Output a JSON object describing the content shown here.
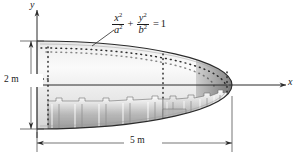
{
  "figure": {
    "background_color": "#ffffff"
  },
  "axes": {
    "y_label": "y",
    "x_label": "x",
    "origin_note": "y-axis at left end of ellipse, x-axis along centerline"
  },
  "equation": {
    "numerator_1": "x",
    "numerator_1_exp": "2",
    "denominator_1": "a",
    "denominator_1_exp": "2",
    "operator": "+",
    "numerator_2": "y",
    "numerator_2_exp": "2",
    "denominator_2": "b",
    "denominator_2_exp": "2",
    "equals": "=",
    "result": "1",
    "plain": "x^2/a^2 + y^2/b^2 = 1"
  },
  "dimensions": {
    "height_label": "2 m",
    "length_label": "5 m"
  },
  "colors": {
    "outline": "#2b2b2b",
    "skin_light": "#f4f4f4",
    "skin_mid": "#d2d2d2",
    "skin_dark": "#8d8d8d",
    "nose_dark": "#6e6e6e",
    "rivet": "#2b2b2b",
    "dimension_line": "#3a3a3a"
  },
  "geometry": {
    "ellipse_center_x": 232,
    "ellipse_center_y": 85,
    "semi_axis_a": 195,
    "semi_axis_b": 44,
    "left_edge_x": 37,
    "nose_tip_x": 232,
    "centerline_y": 85,
    "top_y": 41,
    "bottom_y": 129
  },
  "structure": {
    "rib_count_front": 7,
    "rib_count_rear": 6,
    "rivet_rows": 3,
    "description": "Internal ribbed stringer panels below centerline; riveted skin indicated by dotted lines"
  }
}
